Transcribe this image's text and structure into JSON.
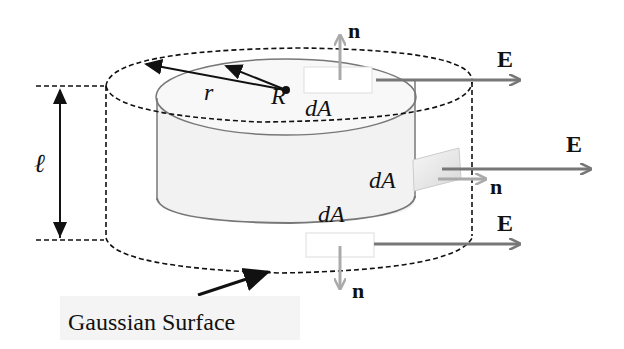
{
  "diagram": {
    "labels": {
      "R": "R",
      "r": "r",
      "length": "ℓ",
      "dA_top": "dA",
      "dA_side": "dA",
      "dA_bottom": "dA",
      "n_top": "n",
      "n_side": "n",
      "n_bottom": "n",
      "E_top": "E",
      "E_side": "E",
      "E_bottom": "E",
      "caption": "Gaussian Surface"
    },
    "colors": {
      "outline": "#111111",
      "cylinder_edge": "#777777",
      "cylinder_fill": "#efefef",
      "field_arrow": "#777777",
      "normal_arrow": "#a8a8a8"
    }
  }
}
